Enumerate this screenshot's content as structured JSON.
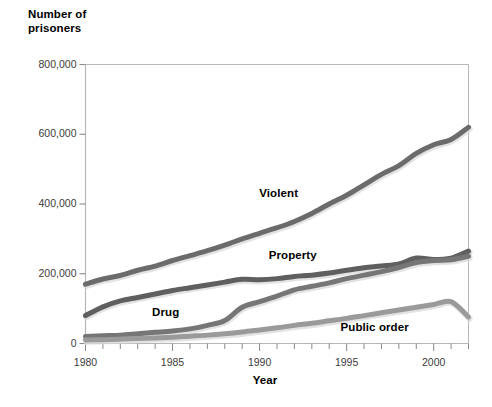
{
  "chart_data": {
    "type": "line",
    "title": "",
    "xlabel": "Year",
    "ylabel": "Number of prisoners",
    "ylabel_lines": [
      "Number of",
      "prisoners"
    ],
    "xlim": [
      1980,
      2002
    ],
    "ylim": [
      0,
      800000
    ],
    "grid": false,
    "legend_position": "inline-labels",
    "y_ticks": [
      0,
      200000,
      400000,
      600000,
      800000
    ],
    "y_tick_labels": [
      "0",
      "200,000",
      "400,000",
      "600,000",
      "800,000"
    ],
    "x_ticks": [
      1980,
      1985,
      1990,
      1995,
      2000
    ],
    "x_tick_labels": [
      "1980",
      "1985",
      "1990",
      "1995",
      "2000"
    ],
    "x_minor_tick_step": 1,
    "x": [
      1980,
      1981,
      1982,
      1983,
      1984,
      1985,
      1986,
      1987,
      1988,
      1989,
      1990,
      1991,
      1992,
      1993,
      1994,
      1995,
      1996,
      1997,
      1998,
      1999,
      2000,
      2001,
      2002
    ],
    "series": [
      {
        "name": "Violent",
        "color": "#6b6b6b",
        "label_x": 1991.1,
        "label_y": 430000,
        "values": [
          170000,
          185000,
          195000,
          210000,
          222000,
          238000,
          252000,
          266000,
          282000,
          300000,
          316000,
          332000,
          350000,
          373000,
          400000,
          425000,
          455000,
          485000,
          510000,
          545000,
          570000,
          585000,
          620000
        ]
      },
      {
        "name": "Property",
        "color": "#5f5f5f",
        "label_x": 1991.9,
        "label_y": 252000,
        "values": [
          80000,
          105000,
          122000,
          132000,
          142000,
          152000,
          160000,
          168000,
          176000,
          184000,
          183000,
          186000,
          192000,
          196000,
          202000,
          210000,
          217000,
          222000,
          228000,
          245000,
          241000,
          245000,
          265000
        ]
      },
      {
        "name": "Drug",
        "color": "#767676",
        "label_x": 1984.6,
        "label_y": 88000,
        "values": [
          20000,
          22000,
          24000,
          28000,
          32000,
          36000,
          42000,
          52000,
          66000,
          104000,
          120000,
          136000,
          154000,
          164000,
          174000,
          186000,
          196000,
          206000,
          218000,
          232000,
          238000,
          240000,
          250000
        ]
      },
      {
        "name": "Public order",
        "color": "#9a9a9a",
        "label_x": 1996.6,
        "label_y": 44000,
        "values": [
          10000,
          11000,
          12500,
          14000,
          16000,
          18000,
          21000,
          24000,
          28000,
          33000,
          39000,
          45000,
          52000,
          58000,
          65000,
          72000,
          80000,
          88000,
          96000,
          104000,
          112000,
          120000,
          76000
        ]
      }
    ]
  },
  "axes": {
    "frame_color": "#b7b7b7",
    "tick_color": "#8a8a8a"
  }
}
